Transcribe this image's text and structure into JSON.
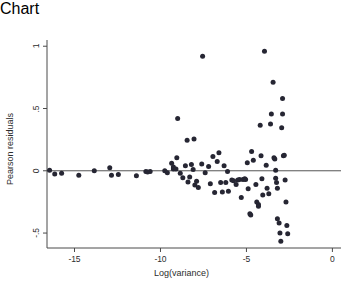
{
  "chart_data": {
    "type": "scatter",
    "title": "",
    "xlabel": "Log(variance)",
    "ylabel": "Pearson residuals",
    "xlim": [
      -16.6,
      0.5
    ],
    "ylim": [
      -0.62,
      1.05
    ],
    "xticks": [
      -15,
      -10,
      -5,
      0
    ],
    "xtick_labels": [
      "-15",
      "-10",
      "-5",
      "0"
    ],
    "yticks": [
      1,
      0.5,
      0,
      -0.5
    ],
    "ytick_labels": [
      "1",
      ".5",
      "0",
      "-.5"
    ],
    "grid": false,
    "legend": null,
    "marker_color": "#262633",
    "marker_size": 5,
    "reference_lines": [
      {
        "orientation": "horizontal",
        "value": 0,
        "color": "#555555"
      }
    ],
    "points": [
      [
        -16.45,
        0.005
      ],
      [
        -16.15,
        -0.025
      ],
      [
        -15.75,
        -0.02
      ],
      [
        -14.75,
        -0.035
      ],
      [
        -13.85,
        0.0
      ],
      [
        -12.95,
        0.025
      ],
      [
        -12.85,
        -0.035
      ],
      [
        -12.45,
        -0.03
      ],
      [
        -11.4,
        -0.04
      ],
      [
        -10.85,
        -0.005
      ],
      [
        -10.6,
        -0.005
      ],
      [
        -10.75,
        -0.01
      ],
      [
        -9.75,
        0.0
      ],
      [
        -9.6,
        -0.015
      ],
      [
        -9.35,
        0.06
      ],
      [
        -9.25,
        0.015
      ],
      [
        -9.25,
        0.03
      ],
      [
        -9.1,
        0.015
      ],
      [
        -9.05,
        0.105
      ],
      [
        -9.0,
        0.42
      ],
      [
        -8.85,
        -0.02
      ],
      [
        -8.7,
        -0.055
      ],
      [
        -8.55,
        0.04
      ],
      [
        -8.45,
        0.245
      ],
      [
        -8.4,
        -0.09
      ],
      [
        -8.3,
        -0.05
      ],
      [
        -8.2,
        0.05
      ],
      [
        -8.1,
        0.01
      ],
      [
        -8.05,
        0.255
      ],
      [
        -8.0,
        -0.115
      ],
      [
        -7.9,
        -0.085
      ],
      [
        -7.8,
        -0.135
      ],
      [
        -7.6,
        0.055
      ],
      [
        -7.55,
        0.92
      ],
      [
        -7.4,
        -0.015
      ],
      [
        -7.2,
        0.035
      ],
      [
        -7.1,
        -0.105
      ],
      [
        -6.95,
        0.115
      ],
      [
        -6.85,
        -0.175
      ],
      [
        -6.7,
        0.075
      ],
      [
        -6.6,
        0.145
      ],
      [
        -6.5,
        -0.095
      ],
      [
        -6.4,
        -0.17
      ],
      [
        -6.3,
        0.04
      ],
      [
        -6.2,
        -0.095
      ],
      [
        -6.1,
        -0.005
      ],
      [
        -6.05,
        -0.165
      ],
      [
        -5.85,
        -0.075
      ],
      [
        -5.75,
        -0.08
      ],
      [
        -5.6,
        -0.11
      ],
      [
        -5.5,
        -0.075
      ],
      [
        -5.4,
        -0.07
      ],
      [
        -5.3,
        -0.215
      ],
      [
        -5.2,
        -0.07
      ],
      [
        -5.1,
        -0.065
      ],
      [
        -5.05,
        -0.07
      ],
      [
        -4.95,
        0.065
      ],
      [
        -4.9,
        -0.145
      ],
      [
        -4.8,
        -0.345
      ],
      [
        -4.75,
        -0.355
      ],
      [
        -4.7,
        0.155
      ],
      [
        -4.6,
        0.085
      ],
      [
        -4.45,
        -0.11
      ],
      [
        -4.4,
        -0.25
      ],
      [
        -4.3,
        -0.27
      ],
      [
        -4.3,
        -0.285
      ],
      [
        -4.2,
        0.365
      ],
      [
        -4.15,
        0.12
      ],
      [
        -4.1,
        -0.065
      ],
      [
        -4.05,
        -0.195
      ],
      [
        -3.95,
        0.96
      ],
      [
        -3.85,
        0.045
      ],
      [
        -3.8,
        -0.14
      ],
      [
        -3.7,
        -0.185
      ],
      [
        -3.6,
        0.375
      ],
      [
        -3.55,
        0.455
      ],
      [
        -3.45,
        0.71
      ],
      [
        -3.4,
        0.105
      ],
      [
        -3.35,
        0.095
      ],
      [
        -3.3,
        0.005
      ],
      [
        -3.3,
        -0.06
      ],
      [
        -3.25,
        -0.095
      ],
      [
        -3.2,
        -0.14
      ],
      [
        -3.2,
        -0.385
      ],
      [
        -3.1,
        -0.42
      ],
      [
        -3.05,
        -0.5
      ],
      [
        -3.0,
        -0.565
      ],
      [
        -2.95,
        0.345
      ],
      [
        -2.9,
        0.455
      ],
      [
        -2.9,
        0.58
      ],
      [
        -2.85,
        0.12
      ],
      [
        -2.8,
        0.125
      ],
      [
        -2.75,
        -0.075
      ],
      [
        -2.7,
        -0.25
      ],
      [
        -2.65,
        -0.44
      ],
      [
        -2.6,
        -0.505
      ]
    ]
  },
  "axes": {
    "x_title": "Log(variance)",
    "y_title": "Pearson residuals"
  }
}
